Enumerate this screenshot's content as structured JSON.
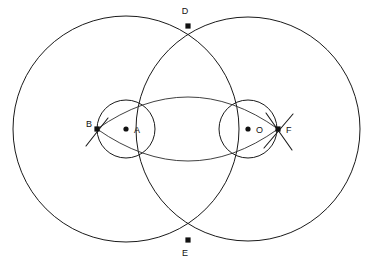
{
  "figure": {
    "kind": "geometric-construction",
    "background_color": "#ffffff",
    "stroke_color": "#1a1a1a",
    "width": 372,
    "height": 268
  },
  "labels": {
    "A": "A",
    "B": "B",
    "D": "D",
    "E": "E",
    "F": "F",
    "O": "O"
  },
  "points": [
    {
      "name": "A",
      "label": "A",
      "x": 126,
      "y": 129,
      "label_x": 134,
      "label_y": 133,
      "role": "center-of-left-circles"
    },
    {
      "name": "B",
      "label": "B",
      "x": 97,
      "y": 129,
      "label_x": 86,
      "label_y": 127,
      "role": "left-intersection-point"
    },
    {
      "name": "D",
      "label": "D",
      "x": 188,
      "y": 26,
      "label_x": 185,
      "label_y": 14,
      "role": "upper-intersection-of-large-circles"
    },
    {
      "name": "E",
      "label": "E",
      "x": 188,
      "y": 240,
      "label_x": 185,
      "label_y": 256,
      "role": "lower-intersection-of-large-circles"
    },
    {
      "name": "F",
      "label": "F",
      "x": 278,
      "y": 129,
      "label_x": 286,
      "label_y": 133,
      "role": "right-intersection-point"
    },
    {
      "name": "O",
      "label": "O",
      "x": 248,
      "y": 129,
      "label_x": 256,
      "label_y": 133,
      "role": "center-of-right-circles"
    }
  ],
  "shapes": {
    "large_circle_left": {
      "cx": 126,
      "cy": 129,
      "r": 113
    },
    "large_circle_right": {
      "cx": 248,
      "cy": 129,
      "r": 112
    },
    "small_circle_left": {
      "cx": 126,
      "cy": 129,
      "r": 29
    },
    "small_circle_right": {
      "cx": 248,
      "cy": 129,
      "r": 29
    },
    "lens_upper_arc": {
      "from_x": 97,
      "from_y": 129,
      "to_x": 278,
      "to_y": 129,
      "apex_x": 188,
      "apex_y": 97
    },
    "lens_lower_arc": {
      "from_x": 97,
      "from_y": 129,
      "to_x": 278,
      "to_y": 129,
      "apex_x": 188,
      "apex_y": 161
    }
  },
  "tick_marks": [
    {
      "name": "tick-at-B",
      "x1": 86,
      "y1": 146,
      "x2": 108,
      "y2": 118
    },
    {
      "name": "tick-at-F-down",
      "x1": 266,
      "y1": 113,
      "x2": 292,
      "y2": 150
    },
    {
      "name": "tick-at-F-up",
      "x1": 264,
      "y1": 148,
      "x2": 293,
      "y2": 114
    }
  ]
}
